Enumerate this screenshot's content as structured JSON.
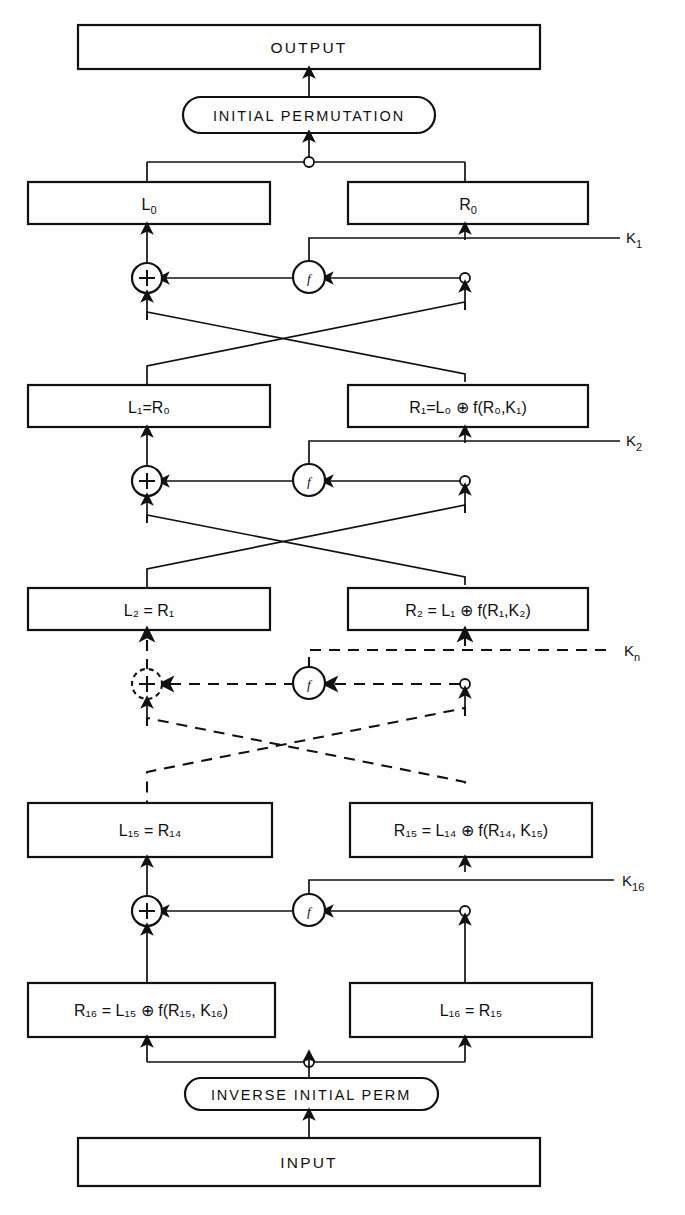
{
  "diagram": {
    "type": "des-decryption-flow",
    "title_top": "OUTPUT",
    "title_bottom": "INPUT",
    "perm_top": "INITIAL PERMUTATION",
    "perm_bottom": "INVERSE INITIAL PERM",
    "xor_glyph": "+",
    "f_glyph": "f"
  },
  "boxes": {
    "output": "OUTPUT",
    "input": "INPUT",
    "initial_permutation": "INITIAL PERMUTATION",
    "inverse_initial_perm": "INVERSE INITIAL PERM",
    "L0": "L",
    "L0_sub": "0",
    "R0": "R",
    "R0_sub": "0",
    "L1": "L₁=R₀",
    "R1": "R₁=L₀ ⊕ f(R₀,K₁)",
    "L2": "L₂ = R₁",
    "R2": "R₂ = L₁ ⊕ f(R₁,K₂)",
    "L15": "L₁₅ = R₁₄",
    "R15": "R₁₅ = L₁₄ ⊕ f(R₁₄, K₁₅)",
    "R16": "R₁₆ = L₁₅ ⊕ f(R₁₅, K₁₆)",
    "L16": "L₁₆ = R₁₅"
  },
  "keys": [
    {
      "id": "k1",
      "label": "K",
      "sub": "1",
      "style": "solid"
    },
    {
      "id": "k2",
      "label": "K",
      "sub": "2",
      "style": "solid"
    },
    {
      "id": "kn",
      "label": "K",
      "sub": "n",
      "style": "dashed"
    },
    {
      "id": "k16",
      "label": "K",
      "sub": "16",
      "style": "solid"
    }
  ],
  "rounds": [
    {
      "name": "round-1",
      "left": "L0",
      "right": "R0",
      "key": "K1",
      "style": "solid"
    },
    {
      "name": "round-2",
      "left": "L1",
      "right": "R1",
      "key": "K2",
      "style": "solid"
    },
    {
      "name": "round-n",
      "left": "L2",
      "right": "R2",
      "key": "Kn",
      "style": "dashed"
    },
    {
      "name": "round-16",
      "left": "L15",
      "right": "R15",
      "key": "K16",
      "style": "solid"
    }
  ],
  "colors": {
    "ink": "#111111",
    "paper": "#ffffff"
  }
}
